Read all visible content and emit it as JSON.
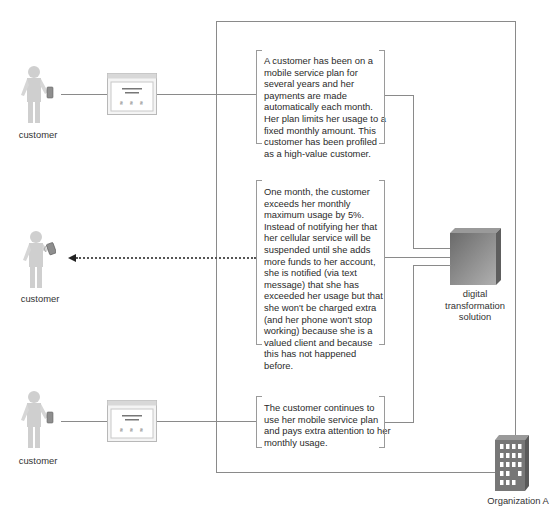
{
  "diagram": {
    "colors": {
      "line": "#8a8a8a",
      "figure": "#cfcfcf",
      "server_dark": "#6f6f6f",
      "server_light": "#a8a8a8",
      "building": "#777777"
    },
    "actors": [
      {
        "label": "customer",
        "device": "phone-icon",
        "screen": true
      },
      {
        "label": "customer",
        "device": "phone-icon",
        "screen": false,
        "receives_message": true
      },
      {
        "label": "customer",
        "device": "phone-icon",
        "screen": true
      }
    ],
    "steps": [
      {
        "text": "A customer has been on a mobile service plan for several years and her payments are made automatically each month. Her plan limits her usage to a fixed monthly amount. This customer has been profiled as a high-value customer."
      },
      {
        "text": "One month, the customer exceeds her monthly maximum usage by 5%. Instead of notifying her that her cellular service will be suspended until she adds more funds to her account, she is notified (via text message) that she has exceeded her usage but that she won't be charged extra (and her phone won't stop working) because she is a valued client and because this has not happened before."
      },
      {
        "text": "The customer continues to use her mobile service plan and pays extra attention to her monthly usage."
      }
    ],
    "system": {
      "label_lines": [
        "digital",
        "transformation",
        "solution"
      ]
    },
    "organization": {
      "label": "Organization A"
    }
  }
}
